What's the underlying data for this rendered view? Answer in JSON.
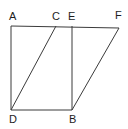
{
  "figure": {
    "name": "geometry-diagram-parallelogram",
    "background_color": "#ffffff",
    "stroke_color": "#3b3b3b",
    "label_color": "#1d1d1d",
    "stroke_width": 1,
    "canvas": {
      "width": 128,
      "height": 129
    },
    "points": {
      "A": {
        "label": "A",
        "x": 11,
        "y": 26,
        "label_x": 9,
        "label_y": 11
      },
      "C": {
        "label": "C",
        "x": 56,
        "y": 26,
        "label_x": 52,
        "label_y": 11
      },
      "E": {
        "label": "E",
        "x": 72,
        "y": 26,
        "label_x": 68,
        "label_y": 11
      },
      "F": {
        "label": "F",
        "x": 119,
        "y": 28,
        "label_x": 115,
        "label_y": 10
      },
      "D": {
        "label": "D",
        "x": 11,
        "y": 110,
        "label_x": 9,
        "label_y": 114
      },
      "B": {
        "label": "B",
        "x": 72,
        "y": 110,
        "label_x": 69,
        "label_y": 114
      }
    },
    "segments": [
      {
        "name": "segment-A-F-top",
        "from": "A",
        "to": "F",
        "d": "M 11 26 L 119 28"
      },
      {
        "name": "segment-A-D-left",
        "from": "A",
        "to": "D",
        "d": "M 11 26 L 11 110"
      },
      {
        "name": "segment-D-B-bottom",
        "from": "D",
        "to": "B",
        "d": "M 11 110 L 72 110"
      },
      {
        "name": "segment-E-B-vertical",
        "from": "E",
        "to": "B",
        "d": "M 72 26 L 72 110"
      },
      {
        "name": "segment-D-C-diagonal",
        "from": "D",
        "to": "C",
        "d": "M 11 110 L 56 26"
      },
      {
        "name": "segment-B-F-diagonal",
        "from": "B",
        "to": "F",
        "d": "M 72 110 L 119 28"
      }
    ]
  }
}
